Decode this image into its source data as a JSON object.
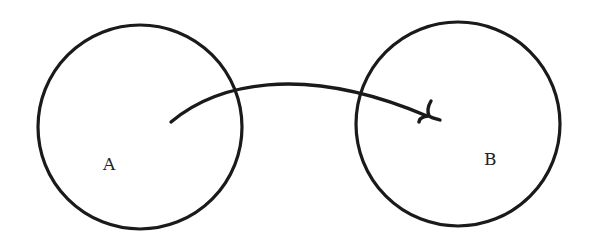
{
  "diagram": {
    "type": "set-mapping",
    "stroke_color": "#1a1a1a",
    "nodes": [
      {
        "id": "A",
        "label": "A",
        "shape": "circle",
        "cx": 140,
        "cy": 127,
        "r": 102,
        "label_x": 103,
        "label_y": 156
      },
      {
        "id": "B",
        "label": "B",
        "shape": "circle",
        "cx": 458,
        "cy": 124,
        "r": 102,
        "label_x": 484,
        "label_y": 151
      }
    ],
    "edges": [
      {
        "from": "A",
        "to": "B",
        "style": "curved-arrow",
        "path": "M171,122 C215,85 300,62 427,116"
      }
    ]
  }
}
